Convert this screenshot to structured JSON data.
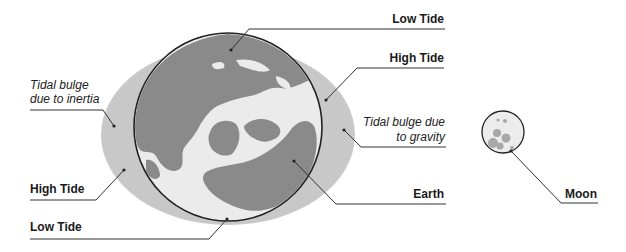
{
  "diagram": {
    "colors": {
      "background": "#ffffff",
      "tidal_bulge": "#c8c8c8",
      "ocean": "#ebebeb",
      "land": "#8a8a8a",
      "outline": "#222222",
      "leader_line": "#333333",
      "moon_fill": "#ececec",
      "moon_crater": "#a8a8a8"
    },
    "labels": {
      "low_tide_top": "Low Tide",
      "high_tide_right": "High Tide",
      "bulge_inertia_line1": "Tidal bulge",
      "bulge_inertia_line2": "due to inertia",
      "bulge_gravity_line1": "Tidal bulge due",
      "bulge_gravity_line2": "to gravity",
      "high_tide_left": "High Tide",
      "low_tide_bottom": "Low Tide",
      "earth": "Earth",
      "moon": "Moon"
    }
  }
}
